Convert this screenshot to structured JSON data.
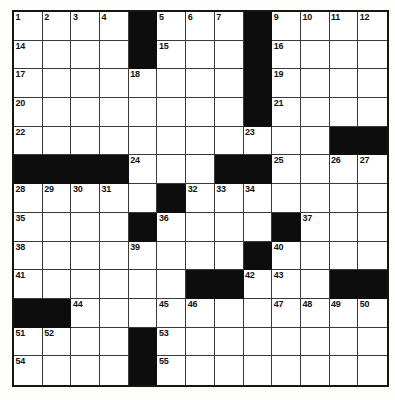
{
  "puzzle": {
    "title": "Crossword Grid",
    "rows": 13,
    "cols": 13,
    "colors": {
      "block": "#0d0d0d",
      "cell": "#ffffff",
      "border": "#3a3a3a",
      "outer_border": "#151515",
      "number_text": "#111111",
      "background": "#ffffff"
    },
    "max_clue_number": 61,
    "grid": [
      [
        "1",
        "2",
        "3",
        "4",
        "#",
        "5",
        "6",
        "7",
        "8",
        "#",
        "9",
        "10",
        "11",
        "12",
        "13"
      ],
      [
        "14",
        "",
        "",
        "",
        "#",
        "15",
        "",
        "",
        "",
        "#",
        "16",
        "",
        "",
        "",
        ""
      ],
      [
        "17",
        "",
        "",
        "",
        "18",
        "",
        "",
        "",
        "",
        "#",
        "19",
        "",
        "",
        "",
        ""
      ],
      [
        "20",
        "",
        "",
        "",
        "",
        "",
        "",
        "",
        "",
        "#",
        "21",
        "",
        "",
        "",
        ""
      ],
      [
        "22",
        "",
        "",
        "",
        "",
        "",
        "",
        "",
        "",
        "23",
        "",
        "",
        "",
        "#",
        "#"
      ],
      [
        "#",
        "#",
        "#",
        "#",
        "24",
        "",
        "",
        "#",
        "#",
        "25",
        "",
        "",
        "26",
        "27",
        ""
      ],
      [
        "28",
        "29",
        "30",
        "31",
        "",
        "#",
        "32",
        "33",
        "34",
        "",
        "",
        "",
        "",
        "",
        ""
      ],
      [
        "35",
        "",
        "",
        "",
        "#",
        "36",
        "",
        "",
        "",
        "",
        "#",
        "37",
        "",
        "",
        ""
      ],
      [
        "38",
        "",
        "",
        "",
        "39",
        "",
        "",
        "",
        "",
        "#",
        "40",
        "",
        "",
        "",
        ""
      ],
      [
        "41",
        "",
        "",
        "",
        "",
        "",
        "#",
        "#",
        "42",
        "43",
        "",
        "#",
        "#",
        "",
        ""
      ],
      [
        "#",
        "#",
        "44",
        "",
        "",
        "45",
        "46",
        "",
        "",
        "47",
        "48",
        "49",
        "50",
        "",
        ""
      ],
      [
        "51",
        "52",
        "",
        "",
        "",
        "#",
        "53",
        "",
        "",
        "",
        "",
        "",
        "",
        "",
        ""
      ],
      [
        "54",
        "",
        "",
        "",
        "",
        "#",
        "55",
        "",
        "",
        "",
        "",
        "",
        "",
        "",
        ""
      ],
      [
        "56",
        "",
        "",
        "",
        "",
        "#",
        "57",
        "",
        "",
        "",
        "#",
        "58",
        "",
        "",
        ""
      ],
      [
        "59",
        "",
        "",
        "",
        "",
        "#",
        "60",
        "",
        "",
        "",
        "#",
        "61",
        "",
        "",
        ""
      ]
    ],
    "blocks": [
      {
        "row": 0,
        "col": 4
      },
      {
        "row": 0,
        "col": 8
      },
      {
        "row": 1,
        "col": 4
      },
      {
        "row": 1,
        "col": 8
      },
      {
        "row": 2,
        "col": 8
      },
      {
        "row": 3,
        "col": 8
      },
      {
        "row": 4,
        "col": 11
      },
      {
        "row": 4,
        "col": 12
      },
      {
        "row": 5,
        "col": 0
      },
      {
        "row": 5,
        "col": 1
      },
      {
        "row": 5,
        "col": 2
      },
      {
        "row": 5,
        "col": 3
      },
      {
        "row": 5,
        "col": 7
      },
      {
        "row": 5,
        "col": 8
      },
      {
        "row": 6,
        "col": 5
      },
      {
        "row": 7,
        "col": 4
      },
      {
        "row": 7,
        "col": 9
      },
      {
        "row": 8,
        "col": 8
      },
      {
        "row": 9,
        "col": 6
      },
      {
        "row": 9,
        "col": 7
      },
      {
        "row": 9,
        "col": 11
      },
      {
        "row": 9,
        "col": 12
      },
      {
        "row": 10,
        "col": 0
      },
      {
        "row": 10,
        "col": 1
      },
      {
        "row": 11,
        "col": 4
      },
      {
        "row": 12,
        "col": 4
      },
      {
        "row": 13,
        "col": 4
      },
      {
        "row": 13,
        "col": 9
      },
      {
        "row": 14,
        "col": 4
      },
      {
        "row": 14,
        "col": 9
      }
    ],
    "numbers": [
      {
        "row": 0,
        "col": 0,
        "n": "1"
      },
      {
        "row": 0,
        "col": 1,
        "n": "2"
      },
      {
        "row": 0,
        "col": 2,
        "n": "3"
      },
      {
        "row": 0,
        "col": 3,
        "n": "4"
      },
      {
        "row": 0,
        "col": 5,
        "n": "5"
      },
      {
        "row": 0,
        "col": 6,
        "n": "6"
      },
      {
        "row": 0,
        "col": 7,
        "n": "7"
      },
      {
        "row": 0,
        "col": 8,
        "n": "8"
      },
      {
        "row": 0,
        "col": 9,
        "n": "9"
      },
      {
        "row": 0,
        "col": 10,
        "n": "10"
      },
      {
        "row": 0,
        "col": 11,
        "n": "11"
      },
      {
        "row": 0,
        "col": 12,
        "n": "12"
      },
      {
        "row": 1,
        "col": 0,
        "n": "14"
      },
      {
        "row": 1,
        "col": 5,
        "n": "15"
      },
      {
        "row": 1,
        "col": 9,
        "n": "16"
      },
      {
        "row": 2,
        "col": 0,
        "n": "17"
      },
      {
        "row": 2,
        "col": 4,
        "n": "18"
      },
      {
        "row": 2,
        "col": 9,
        "n": "19"
      },
      {
        "row": 3,
        "col": 0,
        "n": "20"
      },
      {
        "row": 3,
        "col": 9,
        "n": "21"
      },
      {
        "row": 4,
        "col": 0,
        "n": "22"
      },
      {
        "row": 4,
        "col": 8,
        "n": "23"
      },
      {
        "row": 5,
        "col": 4,
        "n": "24"
      },
      {
        "row": 5,
        "col": 9,
        "n": "25"
      },
      {
        "row": 5,
        "col": 11,
        "n": "26"
      },
      {
        "row": 5,
        "col": 12,
        "n": "27"
      },
      {
        "row": 6,
        "col": 0,
        "n": "28"
      },
      {
        "row": 6,
        "col": 1,
        "n": "29"
      },
      {
        "row": 6,
        "col": 2,
        "n": "30"
      },
      {
        "row": 6,
        "col": 3,
        "n": "31"
      },
      {
        "row": 6,
        "col": 6,
        "n": "32"
      },
      {
        "row": 6,
        "col": 7,
        "n": "33"
      },
      {
        "row": 6,
        "col": 8,
        "n": "34"
      },
      {
        "row": 7,
        "col": 0,
        "n": "35"
      },
      {
        "row": 7,
        "col": 5,
        "n": "36"
      },
      {
        "row": 7,
        "col": 10,
        "n": "37"
      },
      {
        "row": 8,
        "col": 0,
        "n": "38"
      },
      {
        "row": 8,
        "col": 4,
        "n": "39"
      },
      {
        "row": 8,
        "col": 9,
        "n": "40"
      },
      {
        "row": 9,
        "col": 0,
        "n": "41"
      },
      {
        "row": 9,
        "col": 8,
        "n": "42"
      },
      {
        "row": 9,
        "col": 9,
        "n": "43"
      },
      {
        "row": 10,
        "col": 2,
        "n": "44"
      },
      {
        "row": 10,
        "col": 5,
        "n": "45"
      },
      {
        "row": 10,
        "col": 6,
        "n": "46"
      },
      {
        "row": 10,
        "col": 9,
        "n": "47"
      },
      {
        "row": 10,
        "col": 10,
        "n": "48"
      },
      {
        "row": 10,
        "col": 11,
        "n": "49"
      },
      {
        "row": 10,
        "col": 12,
        "n": "50"
      },
      {
        "row": 11,
        "col": 0,
        "n": "51"
      },
      {
        "row": 11,
        "col": 1,
        "n": "52"
      },
      {
        "row": 11,
        "col": 5,
        "n": "53"
      },
      {
        "row": 12,
        "col": 0,
        "n": "54"
      },
      {
        "row": 12,
        "col": 5,
        "n": "55"
      },
      {
        "row": 13,
        "col": 0,
        "n": "56"
      },
      {
        "row": 13,
        "col": 5,
        "n": "57"
      },
      {
        "row": 13,
        "col": 10,
        "n": "58"
      },
      {
        "row": 14,
        "col": 0,
        "n": "59"
      },
      {
        "row": 14,
        "col": 5,
        "n": "60"
      },
      {
        "row": 14,
        "col": 10,
        "n": "61"
      }
    ],
    "entries": []
  }
}
